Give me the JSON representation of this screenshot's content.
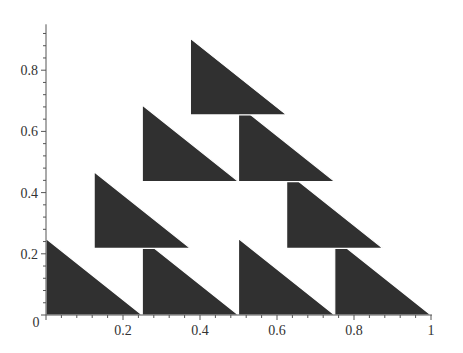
{
  "chart_data": {
    "type": "area",
    "title": "",
    "xlabel": "",
    "ylabel": "",
    "xlim": [
      0,
      1
    ],
    "ylim": [
      0,
      0.95
    ],
    "grid": false,
    "legend": null,
    "fill_color": "#303030",
    "x_ticks": [
      {
        "value": 0,
        "label": "0"
      },
      {
        "value": 0.2,
        "label": "0.2"
      },
      {
        "value": 0.4,
        "label": "0.4"
      },
      {
        "value": 0.6,
        "label": "0.6"
      },
      {
        "value": 0.8,
        "label": "0.8"
      },
      {
        "value": 1,
        "label": "1"
      }
    ],
    "y_ticks": [
      {
        "value": 0.2,
        "label": "0.2"
      },
      {
        "value": 0.4,
        "label": "0.4"
      },
      {
        "value": 0.6,
        "label": "0.6"
      },
      {
        "value": 0.8,
        "label": "0.8"
      }
    ],
    "minor_tick_step": 0.04,
    "shapes_description": "Filled right triangles (vertical left edge, horizontal base, hypotenuse descending left-to-right), each of width 0.25 and height 0.25, arranged in a Sierpinski-like pyramid",
    "triangles": [
      {
        "x": 0.0,
        "y": 0.0,
        "w": 0.25,
        "h": 0.25
      },
      {
        "x": 0.25,
        "y": 0.0,
        "w": 0.25,
        "h": 0.25
      },
      {
        "x": 0.5,
        "y": 0.0,
        "w": 0.25,
        "h": 0.25
      },
      {
        "x": 0.75,
        "y": 0.0,
        "w": 0.25,
        "h": 0.25
      },
      {
        "x": 0.125,
        "y": 0.218,
        "w": 0.25,
        "h": 0.25
      },
      {
        "x": 0.625,
        "y": 0.218,
        "w": 0.25,
        "h": 0.25
      },
      {
        "x": 0.25,
        "y": 0.436,
        "w": 0.25,
        "h": 0.25
      },
      {
        "x": 0.5,
        "y": 0.436,
        "w": 0.25,
        "h": 0.25
      },
      {
        "x": 0.375,
        "y": 0.654,
        "w": 0.25,
        "h": 0.25
      }
    ]
  }
}
